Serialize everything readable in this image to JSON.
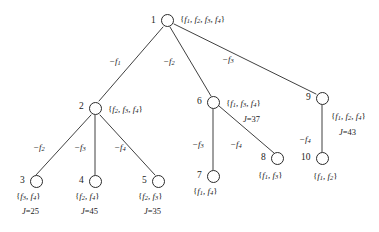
{
  "diagram": {
    "type": "search-tree",
    "title": "",
    "nodes": [
      {
        "id": "1",
        "set": "{f1, f2, f3, f4}",
        "j": "",
        "x": 167,
        "y": 20
      },
      {
        "id": "2",
        "set": "{f2, f3, f4}",
        "j": "",
        "x": 95,
        "y": 108
      },
      {
        "id": "3",
        "set": "{f3, f4}",
        "j": "J=25",
        "x": 30,
        "y": 181
      },
      {
        "id": "4",
        "set": "{f2, f4}",
        "j": "J=45",
        "x": 95,
        "y": 181
      },
      {
        "id": "5",
        "set": "{f2, f3}",
        "j": "J=35",
        "x": 158,
        "y": 181
      },
      {
        "id": "6",
        "set": "{f1, f3, f4}",
        "j": "J=37",
        "x": 213,
        "y": 102
      },
      {
        "id": "7",
        "set": "{f1, f4}",
        "j": "",
        "x": 213,
        "y": 176
      },
      {
        "id": "8",
        "set": "{f1, f3}",
        "j": "",
        "x": 277,
        "y": 158
      },
      {
        "id": "9",
        "set": "{f1, f2, f4}",
        "j": "J=43",
        "x": 322,
        "y": 98
      },
      {
        "id": "10",
        "set": "{f1, f2}",
        "j": "",
        "x": 322,
        "y": 158
      }
    ],
    "edges": [
      {
        "from": "1",
        "to": "2",
        "label": "-f1"
      },
      {
        "from": "1",
        "to": "6",
        "label": "-f2"
      },
      {
        "from": "1",
        "to": "9",
        "label": "-f3"
      },
      {
        "from": "2",
        "to": "3",
        "label": "-f2"
      },
      {
        "from": "2",
        "to": "4",
        "label": "-f3"
      },
      {
        "from": "2",
        "to": "5",
        "label": "-f4"
      },
      {
        "from": "6",
        "to": "7",
        "label": "-f3"
      },
      {
        "from": "6",
        "to": "8",
        "label": "-f4"
      },
      {
        "from": "9",
        "to": "10",
        "label": "-f4"
      }
    ],
    "node_labels": {
      "n1_id": "1",
      "n1_set_base": "f",
      "n1_set": "{f1, f2, f3, f4}",
      "n2_id": "2",
      "n2_set": "{f2, f3, f4}",
      "n3_id": "3",
      "n3_set": "{f3, f4}",
      "n3_j": "J=25",
      "n4_id": "4",
      "n4_set": "{f2, f4}",
      "n4_j": "J=45",
      "n5_id": "5",
      "n5_set": "{f2, f3}",
      "n5_j": "J=35",
      "n6_id": "6",
      "n6_set": "{f1, f3, f4}",
      "n6_j": "J=37",
      "n7_id": "7",
      "n7_set": "{f1, f4}",
      "n8_id": "8",
      "n8_set": "{f1, f3}",
      "n9_id": "9",
      "n9_set": "{f1, f2, f4}",
      "n9_j": "J=43",
      "n10_id": "10",
      "n10_set": "{f1, f2}"
    },
    "edge_labels": {
      "e1_2": "-f1",
      "e1_6": "-f2",
      "e1_9": "-f3",
      "e2_3": "-f2",
      "e2_4": "-f3",
      "e2_5": "-f4",
      "e6_7": "-f3",
      "e6_8": "-f4",
      "e9_10": "-f4"
    },
    "colors": {
      "ink": "#1c1c1c",
      "node_stroke": "#2a2a2a",
      "background": "#ffffff"
    }
  }
}
